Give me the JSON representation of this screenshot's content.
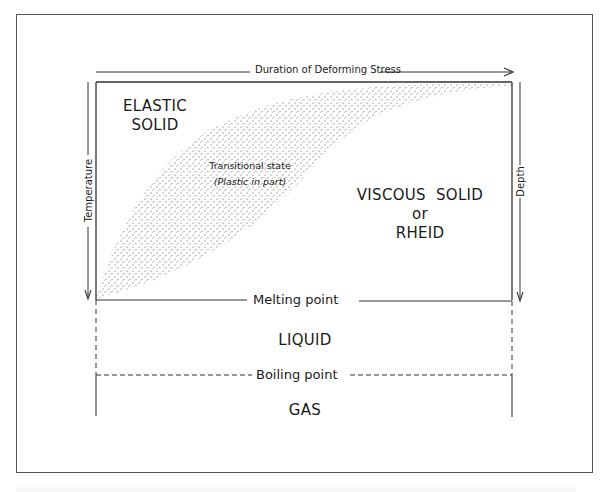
{
  "diagram": {
    "type": "phase-state diagram of earth materials",
    "top_axis": {
      "label": "Duration of Deforming Stress",
      "direction": "right"
    },
    "left_axis": {
      "label": "Temperature",
      "direction": "down"
    },
    "right_axis": {
      "label": "Depth",
      "direction": "down"
    },
    "regions": {
      "elastic_solid": {
        "line1": "ELASTIC",
        "line2": "SOLID"
      },
      "transitional": {
        "line1": "Transitional state",
        "line2": "(Plastic in part)"
      },
      "viscous_solid": {
        "line1": "VISCOUS  SOLID",
        "line2": "or",
        "line3": "RHEID"
      },
      "liquid": {
        "label": "LIQUID"
      },
      "gas": {
        "label": "GAS"
      }
    },
    "boundaries": {
      "melting_point": {
        "label": "Melting point",
        "style": "solid"
      },
      "boiling_point": {
        "label": "Boiling point",
        "style": "dashed"
      }
    },
    "colors": {
      "line": "#333333",
      "stipple": "#444444",
      "frame": "#555555",
      "background": "#ffffff"
    }
  }
}
